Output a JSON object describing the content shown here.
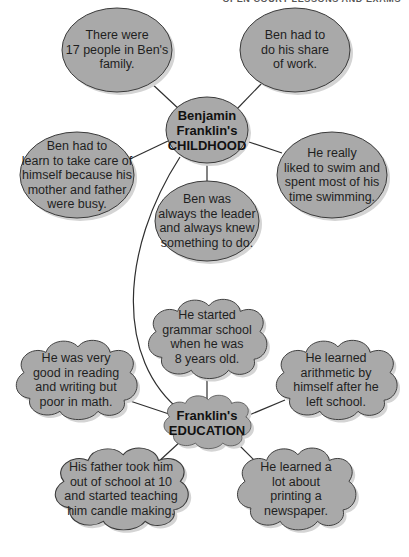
{
  "header": {
    "text": "OPEN COURT LESSONS AND EXAMS"
  },
  "colors": {
    "fill": "#a9a9a9",
    "stroke": "#3a3a3a",
    "shadow": "#d4d4d4",
    "line": "#2f2f2f",
    "background": "#ffffff"
  },
  "childhood": {
    "hub": {
      "lines": [
        "Benjamin",
        "Franklin's",
        "CHILDHOOD"
      ]
    },
    "nodes": [
      {
        "id": "family",
        "lines": [
          "There were",
          "17 people in Ben's",
          "family."
        ]
      },
      {
        "id": "work",
        "lines": [
          "Ben had to",
          "do his share",
          "of work."
        ]
      },
      {
        "id": "selfcare",
        "lines": [
          "Ben had to",
          "learn to take care of",
          "himself because his",
          "mother and father",
          "were busy."
        ]
      },
      {
        "id": "swim",
        "lines": [
          "He really",
          "liked to swim and",
          "spent most of his",
          "time swimming."
        ]
      },
      {
        "id": "leader",
        "lines": [
          "Ben was",
          "always the leader",
          "and always knew",
          "something to do."
        ]
      }
    ]
  },
  "education": {
    "hub": {
      "lines": [
        "Franklin's",
        "EDUCATION"
      ]
    },
    "nodes": [
      {
        "id": "grammar",
        "lines": [
          "He started",
          "grammar school",
          "when he was",
          "8 years old."
        ]
      },
      {
        "id": "reading",
        "lines": [
          "He was very",
          "good in reading",
          "and writing but",
          "poor in math."
        ]
      },
      {
        "id": "arithmetic",
        "lines": [
          "He learned",
          "arithmetic by",
          "himself after he",
          "left school."
        ]
      },
      {
        "id": "candle",
        "lines": [
          "His father took him",
          "out of school at 10",
          "and started teaching",
          "him candle making."
        ]
      },
      {
        "id": "printing",
        "lines": [
          "He learned a",
          "lot about",
          "printing a",
          "newspaper."
        ]
      }
    ]
  }
}
